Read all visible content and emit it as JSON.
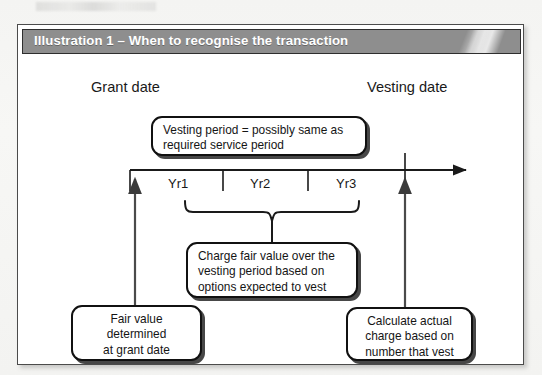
{
  "figure": {
    "title": "Illustration 1 – When to recognise the transaction",
    "accent_header_color": "#8e8e8e",
    "frame_border_color": "#4b4b4b",
    "title_color": "#ffffff"
  },
  "labels": {
    "grant_date": "Grant date",
    "vesting_date": "Vesting date"
  },
  "timeline": {
    "segments": [
      {
        "name": "Yr1",
        "label": "Yr1"
      },
      {
        "name": "Yr2",
        "label": "Yr2"
      },
      {
        "name": "Yr3",
        "label": "Yr3"
      }
    ]
  },
  "callouts": {
    "vesting_period": {
      "line1": "Vesting period = possibly same as",
      "line2": "required service period"
    },
    "charge_fair_value": {
      "line1": "Charge fair value over the",
      "line2": "vesting period based on",
      "line3": "options expected to vest"
    },
    "fair_value_grant": {
      "line1": "Fair value",
      "line2": "determined",
      "line3": "at grant date"
    },
    "calculate_actual": {
      "line1": "Calculate actual",
      "line2": "charge based on",
      "line3": "number that vest"
    }
  }
}
